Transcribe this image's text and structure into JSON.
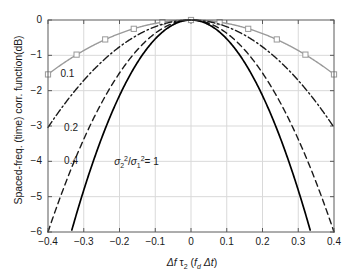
{
  "chart_data": {
    "type": "line",
    "title": "",
    "xlabel": "Δf τ₂ (f_d Δt)",
    "ylabel": "Spaced-freq. (time) corr. function(dB)",
    "xlim": [
      -0.4,
      0.4
    ],
    "ylim": [
      -6,
      0
    ],
    "xticks": [
      -0.4,
      -0.3,
      -0.2,
      -0.1,
      0,
      0.1,
      0.2,
      0.3,
      0.4
    ],
    "xticklabels": [
      "−0.4",
      "−0.3",
      "−0.2",
      "−0.1",
      "0",
      "0.1",
      "0.2",
      "0.3",
      "0.4"
    ],
    "yticks": [
      0,
      -1,
      -2,
      -3,
      -4,
      -5,
      -6
    ],
    "yticklabels": [
      "0",
      "−1",
      "−2",
      "−3",
      "−4",
      "−5",
      "−6"
    ],
    "grid": true,
    "legend_position": "inline-annotations",
    "series": [
      {
        "name": "0.1",
        "ratio": 0.1,
        "style": "solid-with-square-markers",
        "color": "#9a9a9a",
        "marker": "square-open",
        "coefficient": 9.6,
        "x": [
          -0.4,
          -0.32,
          -0.24,
          -0.16,
          -0.08,
          0,
          0.08,
          0.16,
          0.24,
          0.32,
          0.4
        ],
        "y": [
          -1.54,
          -0.98,
          -0.55,
          -0.25,
          -0.06,
          0,
          -0.06,
          -0.25,
          -0.55,
          -0.98,
          -1.54
        ]
      },
      {
        "name": "0.2",
        "ratio": 0.2,
        "style": "dash-dot",
        "color": "#1a1a1a",
        "marker": "none",
        "coefficient": 19.0,
        "x": [
          -0.4,
          -0.32,
          -0.24,
          -0.16,
          -0.08,
          0,
          0.08,
          0.16,
          0.24,
          0.32,
          0.4
        ],
        "y": [
          -3.04,
          -1.95,
          -1.09,
          -0.49,
          -0.12,
          0,
          -0.12,
          -0.49,
          -1.09,
          -1.95,
          -3.04
        ]
      },
      {
        "name": "0.4",
        "ratio": 0.4,
        "style": "dashed",
        "color": "#1a1a1a",
        "marker": "none",
        "coefficient": 37.5,
        "x": [
          -0.4,
          -0.32,
          -0.24,
          -0.16,
          -0.08,
          0,
          0.08,
          0.16,
          0.24,
          0.32,
          0.4
        ],
        "y": [
          -6.0,
          -3.84,
          -2.16,
          -0.96,
          -0.24,
          0,
          -0.24,
          -0.96,
          -2.16,
          -3.84,
          -6.0
        ]
      },
      {
        "name": "1",
        "ratio": 1,
        "style": "solid",
        "color": "#000000",
        "marker": "none",
        "coefficient": 53.5,
        "x": [
          -0.335,
          -0.24,
          -0.16,
          -0.08,
          0,
          0.08,
          0.16,
          0.24,
          0.335
        ],
        "y": [
          -6.0,
          -3.08,
          -1.37,
          -0.34,
          0,
          -0.34,
          -1.37,
          -3.08,
          -6.0
        ]
      }
    ],
    "annotations": [
      {
        "text": "0.1",
        "x": -0.365,
        "y": -1.52,
        "series": "0.1"
      },
      {
        "text": "0.2",
        "x": -0.355,
        "y": -3.05,
        "series": "0.2"
      },
      {
        "text": "0.4",
        "x": -0.355,
        "y": -4.0,
        "series": "0.4"
      },
      {
        "text": "σ₂²/σ₁² = 1",
        "x": -0.215,
        "y": -4.0,
        "series": "1"
      }
    ]
  },
  "axis": {
    "xlabel_parts": {
      "delta_f": "Δf",
      "tau2": "τ",
      "tau2_sub": "2",
      "open": "(",
      "fd": "f",
      "fd_sub": "d",
      "delta_t": "Δt",
      "close": ")"
    },
    "ylabel_text": "Spaced-freq. (time) corr. function(dB)"
  },
  "sigma_annotation": {
    "sigma": "σ",
    "sub2": "2",
    "sup2": "2",
    "slash": "/",
    "sub1": "1",
    "equals": "= 1"
  },
  "colors": {
    "grid": "#d9d9d9",
    "axis": "#5a5a5a",
    "series_gray": "#9a9a9a",
    "series_black": "#1a1a1a",
    "background": "#ffffff"
  }
}
